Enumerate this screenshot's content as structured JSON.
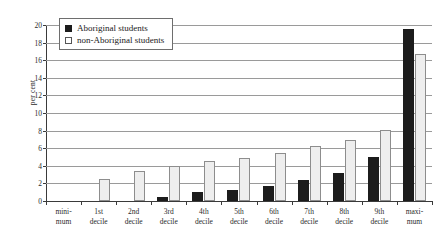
{
  "chart_data": {
    "type": "bar",
    "title": "",
    "xlabel": "",
    "ylabel": "per cent",
    "ylim": [
      0,
      20
    ],
    "yticks": [
      0,
      2,
      4,
      6,
      8,
      10,
      12,
      14,
      16,
      18,
      20
    ],
    "grid": true,
    "legend_position": "top-left",
    "categories": [
      "mini-\nmum",
      "1st\ndecile",
      "2nd\ndecile",
      "3rd\ndecile",
      "4th\ndecile",
      "5th\ndecile",
      "6th\ndecile",
      "7th\ndecile",
      "8th\ndecile",
      "9th\ndecile",
      "maxi-\nmum"
    ],
    "category_lines": [
      [
        "mini-",
        "mum"
      ],
      [
        "1st",
        "decile"
      ],
      [
        "2nd",
        "decile"
      ],
      [
        "3rd",
        "decile"
      ],
      [
        "4th",
        "decile"
      ],
      [
        "5th",
        "decile"
      ],
      [
        "6th",
        "decile"
      ],
      [
        "7th",
        "decile"
      ],
      [
        "8th",
        "decile"
      ],
      [
        "9th",
        "decile"
      ],
      [
        "maxi-",
        "mum"
      ]
    ],
    "series": [
      {
        "name": "Aboriginal students",
        "color": "#1c1c1c",
        "values": [
          0,
          0,
          0,
          0.5,
          1.0,
          1.2,
          1.7,
          2.4,
          3.2,
          5.0,
          19.5
        ]
      },
      {
        "name": "non-Aboriginal students",
        "color": "#eeeeee",
        "values": [
          0,
          2.5,
          3.4,
          4.0,
          4.5,
          4.9,
          5.4,
          6.2,
          6.9,
          8.1,
          16.7
        ]
      }
    ]
  },
  "legend": {
    "items": [
      {
        "label": "Aboriginal students",
        "swatch": "dark"
      },
      {
        "label": "non-Aboriginal students",
        "swatch": "light"
      }
    ]
  }
}
